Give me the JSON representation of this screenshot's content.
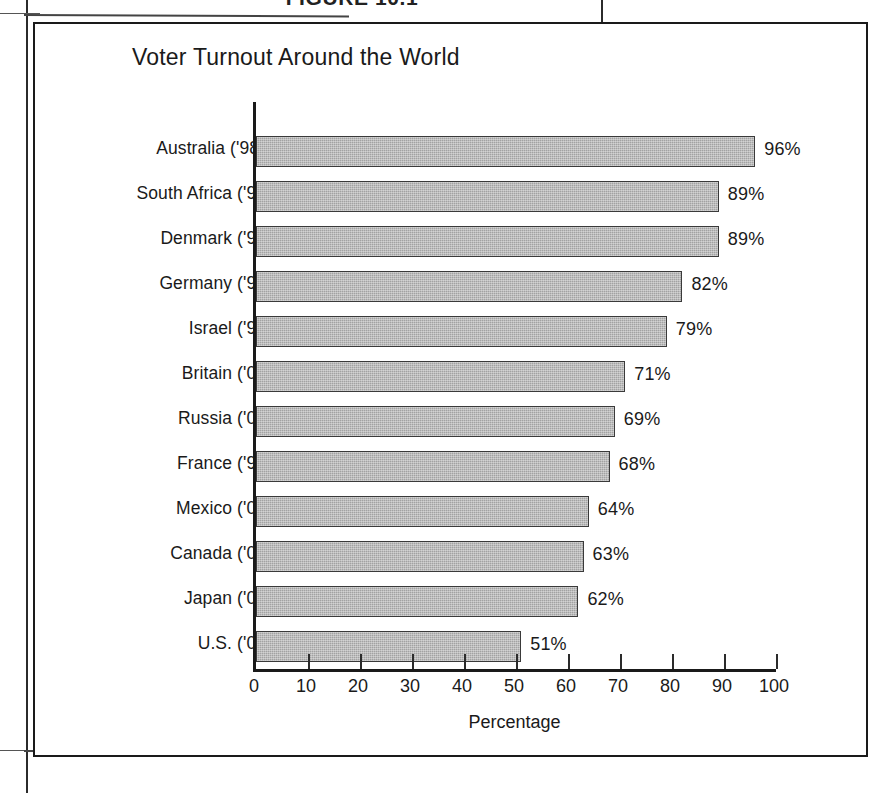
{
  "page": {
    "figure_caption": "FIGURE 10.1"
  },
  "chart": {
    "title": "Voter Turnout Around the World",
    "axis_title": "Percentage",
    "value_suffix": "%"
  },
  "chart_data": {
    "type": "bar",
    "orientation": "horizontal",
    "title": "Voter Turnout Around the World",
    "xlabel": "Percentage",
    "ylabel": "",
    "xlim": [
      0,
      100
    ],
    "xticks": [
      0,
      10,
      20,
      30,
      40,
      50,
      60,
      70,
      80,
      90,
      100
    ],
    "grid": false,
    "legend": false,
    "bar_color": "#a2a2a2",
    "bar_border_color": "#3a3a3a",
    "categories": [
      "Australia ('98*)",
      "South Africa ('99)",
      "Denmark ('98)",
      "Germany ('98)",
      "Israel ('99)",
      "Britain ('00)",
      "Russia ('00)",
      "France ('97)",
      "Mexico ('00)",
      "Canada ('00)",
      "Japan ('00)",
      "U.S. ('00)"
    ],
    "values": [
      96,
      89,
      89,
      82,
      79,
      71,
      69,
      68,
      64,
      63,
      62,
      51
    ],
    "value_labels": [
      "96%",
      "89%",
      "89%",
      "82%",
      "79%",
      "71%",
      "69%",
      "68%",
      "64%",
      "63%",
      "62%",
      "51%"
    ]
  }
}
